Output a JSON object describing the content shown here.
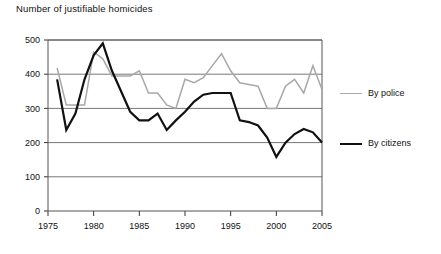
{
  "chart_data": {
    "type": "line",
    "title": "Number of justifiable homicides",
    "xlabel": "",
    "ylabel": "",
    "xlim": [
      1975,
      2005
    ],
    "ylim": [
      0,
      500
    ],
    "ytick_values": [
      0,
      100,
      200,
      300,
      400,
      500
    ],
    "ytick_labels": [
      "0",
      "100",
      "200",
      "300",
      "400",
      "500"
    ],
    "xtick_values": [
      1975,
      1980,
      1985,
      1990,
      1995,
      2000,
      2005
    ],
    "xtick_labels": [
      "1975",
      "1980",
      "1985",
      "1990",
      "1995",
      "2000",
      "2005"
    ],
    "grid": true,
    "grid_axis": "y",
    "legend_position": "right",
    "x": [
      1976,
      1977,
      1978,
      1979,
      1980,
      1981,
      1982,
      1983,
      1984,
      1985,
      1986,
      1987,
      1988,
      1989,
      1990,
      1991,
      1992,
      1993,
      1994,
      1995,
      1996,
      1997,
      1998,
      1999,
      2000,
      2001,
      2002,
      2003,
      2004,
      2005
    ],
    "series": [
      {
        "name": "By police",
        "color": "#a8a8a8",
        "values": [
          418,
          310,
          310,
          310,
          465,
          445,
          395,
          395,
          395,
          410,
          345,
          345,
          310,
          300,
          385,
          375,
          390,
          425,
          460,
          410,
          375,
          370,
          365,
          300,
          300,
          365,
          385,
          345,
          425,
          355
        ]
      },
      {
        "name": "By citizens",
        "color": "#111111",
        "values": [
          385,
          237,
          285,
          385,
          455,
          490,
          410,
          350,
          290,
          265,
          265,
          285,
          237,
          265,
          290,
          320,
          340,
          345,
          345,
          345,
          265,
          260,
          250,
          215,
          158,
          200,
          225,
          240,
          230,
          200
        ]
      }
    ],
    "legend": [
      {
        "label": "By police",
        "color": "#a8a8a8"
      },
      {
        "label": "By citizens",
        "color": "#111111"
      }
    ]
  },
  "axis": {
    "y_labels": [
      "500",
      "400",
      "300",
      "200",
      "100",
      "0"
    ],
    "x_labels": [
      "1975",
      "1980",
      "1985",
      "1990",
      "1995",
      "2000",
      "2005"
    ]
  },
  "legend": {
    "police_label": "By police",
    "citizens_label": "By citizens"
  },
  "title": "Number of justifiable homicides"
}
